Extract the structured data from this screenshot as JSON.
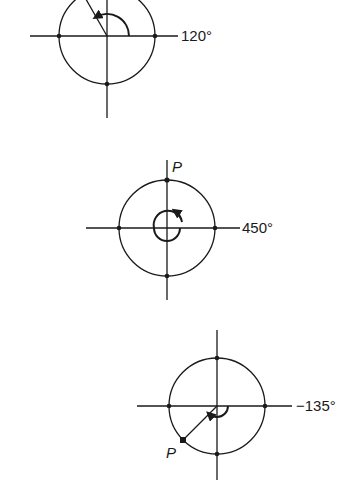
{
  "diagrams": [
    {
      "id": "angle-120",
      "angle_label": "120°",
      "angle_degrees": 120,
      "point_label": ""
    },
    {
      "id": "angle-450",
      "angle_label": "450°",
      "angle_degrees": 450,
      "point_label": "P"
    },
    {
      "id": "angle-neg135",
      "angle_label": "−135°",
      "angle_degrees": -135,
      "point_label": "P"
    }
  ],
  "colors": {
    "stroke": "#1a1a1a",
    "background": "#ffffff"
  }
}
